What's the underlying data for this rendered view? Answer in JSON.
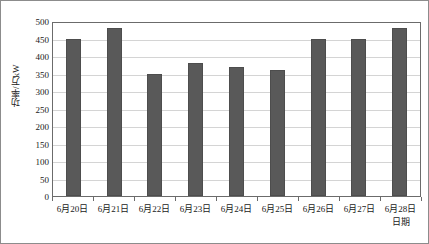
{
  "chart_data": {
    "type": "bar",
    "title": "",
    "subtitle": "",
    "categories": [
      "6月20日",
      "6月21日",
      "6月22日",
      "6月23日",
      "6月24日",
      "6月25日",
      "6月26日",
      "6月27日",
      "6月28日"
    ],
    "values": [
      450,
      480,
      350,
      380,
      370,
      360,
      450,
      450,
      480
    ],
    "xlabel": "日期",
    "ylabel": "功率/万kW",
    "ylim": [
      0,
      500
    ],
    "ytick_step": 50,
    "yticks": [
      500,
      450,
      400,
      350,
      300,
      250,
      200,
      150,
      100,
      50,
      0
    ],
    "grid": true,
    "grid_axis": "y",
    "legend": false,
    "legend_position": "none",
    "series": [
      {
        "name": "功率",
        "values": [
          450,
          480,
          350,
          380,
          370,
          360,
          450,
          450,
          480
        ],
        "color": "#595959"
      }
    ]
  },
  "style": {
    "bar_color": "#595959",
    "bar_border_color": "#4d4d4d",
    "gridline_color": "#d4d4d4",
    "plot_border_color": "#6b6b6b",
    "image_border_color": "#8c8c8c",
    "text_color": "#1a1a1a",
    "background": "#ffffff"
  }
}
